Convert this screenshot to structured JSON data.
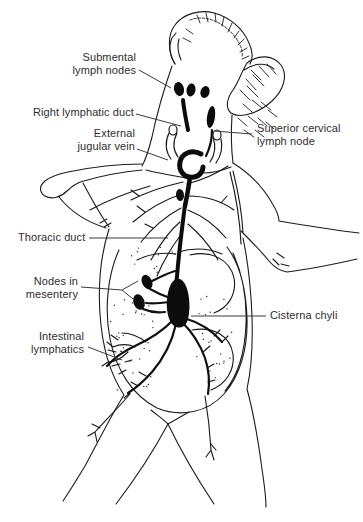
{
  "figure": {
    "illustration_alt": "Black-and-white line drawing of a rodent, ventral view, showing the lymphatic system",
    "background_color": "#ffffff",
    "ink_color": "#1c1c1c",
    "label_color": "#2e2e2e",
    "labels": [
      {
        "id": "submental-lymph-nodes",
        "text": "Submental\nlymph nodes"
      },
      {
        "id": "right-lymphatic-duct",
        "text": "Right lymphatic duct"
      },
      {
        "id": "external-jugular-vein",
        "text": "External\njugular vein"
      },
      {
        "id": "superior-cervical-lymph-node",
        "text": "Superior cervical\nlymph node"
      },
      {
        "id": "thoracic-duct",
        "text": "Thoracic duct"
      },
      {
        "id": "nodes-in-mesentery",
        "text": "Nodes in\nmesentery"
      },
      {
        "id": "cisterna-chyli",
        "text": "Cisterna chyli"
      },
      {
        "id": "intestinal-lymphatics",
        "text": "Intestinal\nlymphatics"
      }
    ]
  }
}
